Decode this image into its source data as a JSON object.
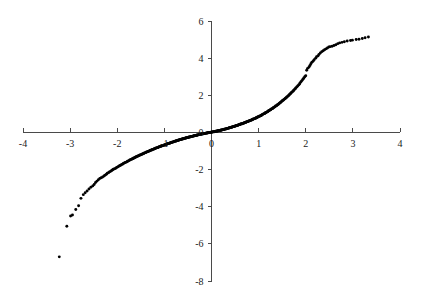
{
  "chart_data": {
    "type": "scatter",
    "title": "",
    "subtitle": "",
    "xlabel": "",
    "ylabel": "",
    "xlim": [
      -4,
      4
    ],
    "ylim": [
      -8,
      6
    ],
    "grid": false,
    "legend": null,
    "legend_position": "none",
    "x_ticks": [
      -4,
      -3,
      -2,
      -1,
      0,
      1,
      2,
      3,
      4
    ],
    "x_tick_labels": [
      "-4",
      "-3",
      "-2",
      "-1",
      "0",
      "1",
      "2",
      "3",
      "4"
    ],
    "y_ticks": [
      -8,
      -6,
      -4,
      -2,
      0,
      2,
      4,
      6
    ],
    "y_tick_labels": [
      "-8",
      "-6",
      "-4",
      "-2",
      "0",
      "2",
      "4",
      "6"
    ],
    "axes_cross_at": [
      0,
      0
    ],
    "marker": "filled-circle",
    "marker_color": "#000000",
    "marker_size_px": 2.0,
    "x": [
      -3.23,
      -3.07,
      -2.99,
      -2.95,
      -2.88,
      -2.82,
      -2.77,
      -2.72,
      -2.68,
      -2.64,
      -2.6,
      -2.56,
      -2.52,
      -2.49,
      -2.46,
      -2.43,
      -2.4,
      -2.37,
      -2.34,
      -2.31,
      -2.28,
      -2.26,
      -2.23,
      -2.21,
      -2.18,
      -2.16,
      -2.13,
      -2.11,
      -2.09,
      -2.07,
      -2.04,
      -2.02,
      -2.0,
      -1.98,
      -1.96,
      -1.94,
      -1.92,
      -1.9,
      -1.88,
      -1.87,
      -1.85,
      -1.83,
      -1.81,
      -1.79,
      -1.78,
      -1.76,
      -1.74,
      -1.73,
      -1.71,
      -1.69,
      -1.68,
      -1.66,
      -1.65,
      -1.63,
      -1.62,
      -1.6,
      -1.59,
      -1.57,
      -1.56,
      -1.54,
      -1.53,
      -1.51,
      -1.5,
      -1.48,
      -1.47,
      -1.46,
      -1.44,
      -1.43,
      -1.42,
      -1.4,
      -1.39,
      -1.38,
      -1.36,
      -1.35,
      -1.34,
      -1.32,
      -1.31,
      -1.3,
      -1.29,
      -1.27,
      -1.26,
      -1.25,
      -1.24,
      -1.22,
      -1.21,
      -1.2,
      -1.19,
      -1.18,
      -1.16,
      -1.15,
      -1.14,
      -1.13,
      -1.12,
      -1.11,
      -1.09,
      -1.08,
      -1.07,
      -1.06,
      -1.05,
      -1.04,
      -1.03,
      -1.01,
      -1.0,
      -0.99,
      -0.98,
      -0.97,
      -0.96,
      -0.95,
      -0.94,
      -0.93,
      -0.92,
      -0.9,
      -0.89,
      -0.88,
      -0.87,
      -0.86,
      -0.85,
      -0.84,
      -0.83,
      -0.82,
      -0.81,
      -0.8,
      -0.79,
      -0.78,
      -0.77,
      -0.76,
      -0.75,
      -0.74,
      -0.73,
      -0.72,
      -0.71,
      -0.7,
      -0.69,
      -0.68,
      -0.67,
      -0.66,
      -0.65,
      -0.64,
      -0.63,
      -0.62,
      -0.61,
      -0.6,
      -0.59,
      -0.58,
      -0.57,
      -0.56,
      -0.55,
      -0.54,
      -0.53,
      -0.52,
      -0.51,
      -0.5,
      -0.49,
      -0.48,
      -0.47,
      -0.46,
      -0.45,
      -0.44,
      -0.43,
      -0.42,
      -0.41,
      -0.4,
      -0.39,
      -0.38,
      -0.37,
      -0.36,
      -0.35,
      -0.34,
      -0.33,
      -0.32,
      -0.31,
      -0.3,
      -0.29,
      -0.28,
      -0.27,
      -0.26,
      -0.25,
      -0.24,
      -0.23,
      -0.22,
      -0.21,
      -0.2,
      -0.19,
      -0.18,
      -0.17,
      -0.16,
      -0.15,
      -0.14,
      -0.13,
      -0.12,
      -0.11,
      -0.1,
      -0.09,
      -0.08,
      -0.07,
      -0.06,
      -0.05,
      -0.04,
      -0.03,
      -0.02,
      -0.01,
      0.0,
      0.01,
      0.02,
      0.03,
      0.04,
      0.05,
      0.06,
      0.07,
      0.08,
      0.09,
      0.1,
      0.11,
      0.12,
      0.13,
      0.14,
      0.15,
      0.16,
      0.17,
      0.18,
      0.19,
      0.2,
      0.21,
      0.22,
      0.23,
      0.24,
      0.25,
      0.26,
      0.27,
      0.28,
      0.29,
      0.3,
      0.31,
      0.32,
      0.33,
      0.34,
      0.35,
      0.36,
      0.37,
      0.38,
      0.39,
      0.4,
      0.41,
      0.42,
      0.43,
      0.44,
      0.45,
      0.46,
      0.47,
      0.48,
      0.49,
      0.5,
      0.51,
      0.52,
      0.53,
      0.54,
      0.55,
      0.56,
      0.57,
      0.58,
      0.59,
      0.6,
      0.61,
      0.62,
      0.63,
      0.64,
      0.65,
      0.66,
      0.67,
      0.68,
      0.69,
      0.7,
      0.71,
      0.72,
      0.73,
      0.74,
      0.75,
      0.76,
      0.77,
      0.78,
      0.79,
      0.8,
      0.81,
      0.82,
      0.83,
      0.84,
      0.85,
      0.86,
      0.87,
      0.88,
      0.89,
      0.9,
      0.92,
      0.93,
      0.94,
      0.95,
      0.96,
      0.97,
      0.98,
      0.99,
      1.0,
      1.01,
      1.03,
      1.04,
      1.05,
      1.06,
      1.07,
      1.08,
      1.09,
      1.11,
      1.12,
      1.13,
      1.14,
      1.15,
      1.16,
      1.18,
      1.19,
      1.2,
      1.21,
      1.22,
      1.24,
      1.25,
      1.26,
      1.27,
      1.29,
      1.3,
      1.31,
      1.32,
      1.34,
      1.35,
      1.36,
      1.38,
      1.39,
      1.4,
      1.42,
      1.43,
      1.44,
      1.46,
      1.47,
      1.48,
      1.5,
      1.51,
      1.53,
      1.54,
      1.56,
      1.57,
      1.59,
      1.6,
      1.62,
      1.63,
      1.65,
      1.66,
      1.68,
      1.69,
      1.71,
      1.73,
      1.74,
      1.76,
      1.78,
      1.79,
      1.81,
      1.83,
      1.85,
      1.87,
      1.88,
      1.9,
      1.92,
      1.94,
      1.96,
      1.98,
      2.0,
      2.02,
      2.04,
      2.07,
      2.09,
      2.11,
      2.13,
      2.16,
      2.18,
      2.21,
      2.23,
      2.26,
      2.28,
      2.31,
      2.34,
      2.37,
      2.4,
      2.43,
      2.46,
      2.49,
      2.52,
      2.56,
      2.6,
      2.64,
      2.68,
      2.72,
      2.77,
      2.82,
      2.88,
      2.95,
      2.99,
      3.07,
      3.13,
      3.2,
      3.26,
      3.33
    ],
    "y": [
      -6.7,
      -5.05,
      -4.5,
      -4.45,
      -4.15,
      -3.95,
      -3.55,
      -3.35,
      -3.25,
      -3.15,
      -3.05,
      -2.95,
      -2.88,
      -2.8,
      -2.7,
      -2.62,
      -2.55,
      -2.48,
      -2.44,
      -2.4,
      -2.35,
      -2.3,
      -2.25,
      -2.2,
      -2.16,
      -2.12,
      -2.08,
      -2.04,
      -2.0,
      -1.97,
      -1.94,
      -1.9,
      -1.87,
      -1.84,
      -1.81,
      -1.78,
      -1.75,
      -1.72,
      -1.7,
      -1.67,
      -1.64,
      -1.62,
      -1.6,
      -1.57,
      -1.55,
      -1.53,
      -1.5,
      -1.48,
      -1.46,
      -1.44,
      -1.42,
      -1.4,
      -1.38,
      -1.36,
      -1.34,
      -1.32,
      -1.3,
      -1.28,
      -1.27,
      -1.25,
      -1.23,
      -1.21,
      -1.2,
      -1.18,
      -1.17,
      -1.15,
      -1.13,
      -1.12,
      -1.1,
      -1.09,
      -1.07,
      -1.06,
      -1.04,
      -1.03,
      -1.02,
      -1.0,
      -0.99,
      -0.97,
      -0.96,
      -0.95,
      -0.93,
      -0.92,
      -0.91,
      -0.89,
      -0.88,
      -0.87,
      -0.86,
      -0.84,
      -0.83,
      -0.82,
      -0.81,
      -0.8,
      -0.79,
      -0.77,
      -0.76,
      -0.75,
      -0.74,
      -0.73,
      -0.72,
      -0.71,
      -0.7,
      -0.69,
      -0.68,
      -0.67,
      -0.66,
      -0.65,
      -0.64,
      -0.63,
      -0.62,
      -0.61,
      -0.6,
      -0.59,
      -0.58,
      -0.57,
      -0.56,
      -0.55,
      -0.54,
      -0.53,
      -0.52,
      -0.52,
      -0.51,
      -0.5,
      -0.49,
      -0.48,
      -0.47,
      -0.46,
      -0.46,
      -0.45,
      -0.44,
      -0.43,
      -0.42,
      -0.42,
      -0.41,
      -0.4,
      -0.39,
      -0.38,
      -0.38,
      -0.37,
      -0.36,
      -0.35,
      -0.35,
      -0.34,
      -0.33,
      -0.32,
      -0.32,
      -0.31,
      -0.3,
      -0.3,
      -0.29,
      -0.28,
      -0.28,
      -0.27,
      -0.26,
      -0.26,
      -0.25,
      -0.24,
      -0.24,
      -0.23,
      -0.22,
      -0.22,
      -0.21,
      -0.2,
      -0.2,
      -0.19,
      -0.18,
      -0.18,
      -0.17,
      -0.17,
      -0.16,
      -0.15,
      -0.15,
      -0.14,
      -0.14,
      -0.13,
      -0.12,
      -0.12,
      -0.11,
      -0.11,
      -0.1,
      -0.1,
      -0.09,
      -0.08,
      -0.08,
      -0.07,
      -0.07,
      -0.06,
      -0.06,
      -0.05,
      -0.05,
      -0.04,
      -0.04,
      -0.03,
      -0.03,
      -0.02,
      -0.02,
      -0.01,
      -0.01,
      -0.0,
      0.0,
      0.0,
      0.01,
      0.01,
      0.02,
      0.02,
      0.03,
      0.03,
      0.04,
      0.04,
      0.05,
      0.05,
      0.06,
      0.06,
      0.07,
      0.08,
      0.08,
      0.09,
      0.09,
      0.1,
      0.1,
      0.11,
      0.12,
      0.12,
      0.13,
      0.13,
      0.14,
      0.15,
      0.15,
      0.16,
      0.17,
      0.17,
      0.18,
      0.19,
      0.19,
      0.2,
      0.21,
      0.22,
      0.22,
      0.23,
      0.24,
      0.25,
      0.25,
      0.26,
      0.27,
      0.28,
      0.28,
      0.29,
      0.3,
      0.31,
      0.32,
      0.32,
      0.33,
      0.34,
      0.35,
      0.36,
      0.37,
      0.37,
      0.38,
      0.39,
      0.4,
      0.41,
      0.42,
      0.43,
      0.44,
      0.45,
      0.46,
      0.46,
      0.47,
      0.48,
      0.49,
      0.5,
      0.51,
      0.52,
      0.53,
      0.54,
      0.55,
      0.56,
      0.57,
      0.58,
      0.59,
      0.6,
      0.61,
      0.62,
      0.63,
      0.64,
      0.65,
      0.66,
      0.67,
      0.68,
      0.7,
      0.71,
      0.72,
      0.73,
      0.75,
      0.76,
      0.77,
      0.79,
      0.8,
      0.81,
      0.83,
      0.84,
      0.85,
      0.87,
      0.88,
      0.9,
      0.91,
      0.93,
      0.94,
      0.96,
      0.98,
      1.0,
      1.01,
      1.03,
      1.05,
      1.06,
      1.08,
      1.1,
      1.12,
      1.14,
      1.16,
      1.18,
      1.2,
      1.22,
      1.24,
      1.26,
      1.28,
      1.3,
      1.32,
      1.35,
      1.37,
      1.39,
      1.42,
      1.44,
      1.47,
      1.49,
      1.52,
      1.54,
      1.57,
      1.6,
      1.63,
      1.66,
      1.69,
      1.72,
      1.75,
      1.78,
      1.81,
      1.84,
      1.88,
      1.91,
      1.95,
      1.98,
      2.02,
      2.06,
      2.1,
      2.14,
      2.18,
      2.22,
      2.26,
      2.31,
      2.35,
      2.4,
      2.45,
      2.5,
      2.56,
      2.61,
      2.67,
      2.73,
      2.79,
      2.86,
      2.93,
      3.0,
      3.05,
      3.35,
      3.45,
      3.52,
      3.6,
      3.7,
      3.78,
      3.85,
      3.92,
      4.0,
      4.08,
      4.12,
      4.2,
      4.28,
      4.35,
      4.4,
      4.45,
      4.5,
      4.55,
      4.6,
      4.62,
      4.64,
      4.68,
      4.72,
      4.78,
      4.82,
      4.85,
      4.88,
      4.92,
      4.95,
      4.97,
      5.0,
      5.02,
      5.06,
      5.1,
      5.14
    ]
  },
  "axes": {
    "x_axis_name": "horizontal-axis",
    "y_axis_name": "vertical-axis"
  }
}
